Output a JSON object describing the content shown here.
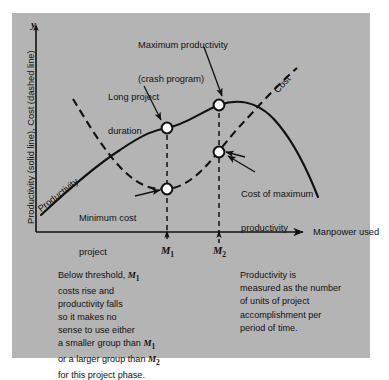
{
  "figure": {
    "background_color": "#b4b4b4",
    "page_color": "#ffffff",
    "ink_color": "#111111"
  },
  "axes": {
    "y_axis_glyph": "y",
    "y_axis_label": "Productivity (solid line), Cost (dashed line)",
    "x_axis_label": "Manpower used",
    "tick_labels": [
      "M",
      "M"
    ],
    "tick_subscripts": [
      "1",
      "2"
    ]
  },
  "curves": {
    "productivity": {
      "name": "Productivity",
      "style": "solid line"
    },
    "cost": {
      "name": "Cost",
      "style": "dashed line"
    }
  },
  "callouts": {
    "max_productivity": {
      "line1": "Maximum productivity",
      "line2": "(crash program)"
    },
    "long_project": {
      "line1": "Long project",
      "line2": "duration"
    },
    "cost_of_max": {
      "line1": "Cost of maximum",
      "line2": "productivity"
    },
    "min_cost": {
      "line1": "Minimum cost",
      "line2": "project"
    }
  },
  "notes": {
    "left": {
      "lines": [
        {
          "pre": "Below threshold, ",
          "var": "M",
          "sub": "1",
          "post": ""
        },
        {
          "pre": "costs rise and",
          "var": "",
          "sub": "",
          "post": ""
        },
        {
          "pre": "productivity falls",
          "var": "",
          "sub": "",
          "post": ""
        },
        {
          "pre": "so it makes no",
          "var": "",
          "sub": "",
          "post": ""
        },
        {
          "pre": "sense to use either",
          "var": "",
          "sub": "",
          "post": ""
        },
        {
          "pre": "a smaller group than ",
          "var": "M",
          "sub": "1",
          "post": ""
        },
        {
          "pre": "or a larger group than ",
          "var": "M",
          "sub": "2",
          "post": ""
        },
        {
          "pre": "for this project phase.",
          "var": "",
          "sub": "",
          "post": ""
        }
      ]
    },
    "right": {
      "lines": [
        "Productivity is",
        "measured as the number",
        "of units of project",
        "accomplishment per",
        "period of time."
      ]
    }
  },
  "chart_data": {
    "type": "line",
    "title": "",
    "xlabel": "Manpower used",
    "ylabel": "Productivity (solid line), Cost (dashed line)",
    "grid": false,
    "legend": "inline curve labels",
    "xlim": [
      0,
      100
    ],
    "ylim": [
      0,
      100
    ],
    "annotated_points": [
      {
        "label": "Long project duration",
        "curve": "Productivity",
        "x": "M1",
        "y_rel": 0.55
      },
      {
        "label": "Maximum productivity (crash program)",
        "curve": "Productivity",
        "x": "M2",
        "y_rel": 0.75
      },
      {
        "label": "Minimum cost project",
        "curve": "Cost",
        "x": "M1",
        "y_rel": 0.18
      },
      {
        "label": "Cost of maximum productivity",
        "curve": "Cost",
        "x": "M2",
        "y_rel": 0.4
      }
    ],
    "series": [
      {
        "name": "Productivity",
        "style": "solid",
        "description": "rises from lower-left, inflects upward, peaks near M2, then falls off to the right"
      },
      {
        "name": "Cost",
        "style": "dashed",
        "description": "falls steeply from upper-left to a minimum near M1, then rises steeply to the upper right"
      }
    ]
  }
}
